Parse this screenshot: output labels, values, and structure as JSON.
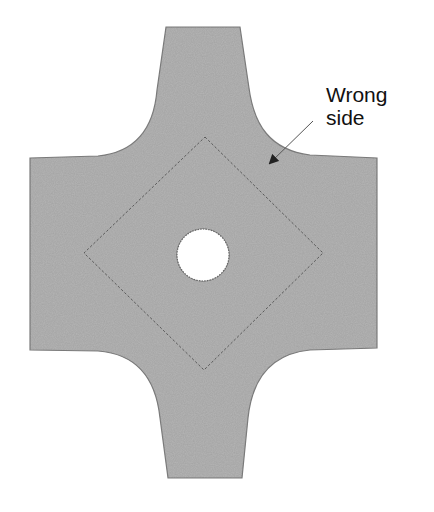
{
  "diagram": {
    "shape": {
      "name": "cross-shaped fabric piece",
      "fill_color": "#b4b4b4",
      "edge_color": "#7a7a7a"
    },
    "stitch_line": {
      "shape": "diamond",
      "style": "dashed",
      "color": "#555555"
    },
    "hole": {
      "shape": "circle",
      "fill_color": "#ffffff"
    },
    "annotation": {
      "line1": "Wrong",
      "line2": "side",
      "arrow_color": "#333333"
    }
  }
}
